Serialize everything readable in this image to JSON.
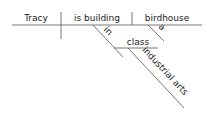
{
  "diagram": {
    "type": "sentence-diagram",
    "sentence": "Tracy is building a birdhouse in class industrial arts",
    "subject": "Tracy",
    "verb": "is building",
    "direct_object": "birdhouse",
    "modifiers": {
      "article": "a",
      "preposition": "in",
      "prep_object": "class",
      "prep_object_modifier": "industrial arts"
    },
    "colors": {
      "line": "#555555",
      "text": "#222222",
      "background": "#ffffff"
    }
  }
}
